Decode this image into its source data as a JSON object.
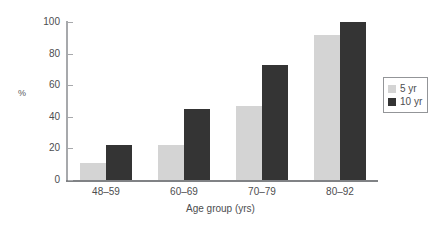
{
  "chart_data": {
    "type": "bar",
    "title": "",
    "subtitle": "",
    "xlabel": "Age group (yrs)",
    "ylabel": "%",
    "categories": [
      "48–59",
      "60–69",
      "70–79",
      "80–92"
    ],
    "series": [
      {
        "name": "5 yr",
        "values": [
          11,
          22,
          47,
          92
        ],
        "color": "#d4d4d4"
      },
      {
        "name": "10 yr",
        "values": [
          22,
          45,
          73,
          100
        ],
        "color": "#343434"
      }
    ],
    "ylim": [
      0,
      100
    ],
    "yticks": [
      0,
      20,
      40,
      60,
      80,
      100
    ],
    "ytick_labels": [
      "0",
      "20",
      "40",
      "60",
      "80",
      "100"
    ],
    "grid": false,
    "legend_position": "right",
    "legend_entries": [
      {
        "label": "5 yr",
        "color": "#d4d4d4"
      },
      {
        "label": "10 yr",
        "color": "#343434"
      }
    ],
    "axis_color": "#808285",
    "text_color": "#4d4d4f"
  }
}
